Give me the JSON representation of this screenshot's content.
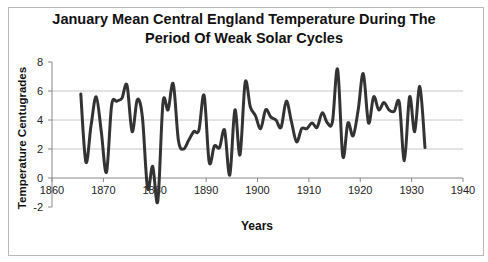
{
  "chart_data": {
    "type": "line",
    "title": "January Mean Central England Temperature During The Period Of Weak Solar Cycles",
    "title_lines": [
      "January Mean Central England Temperature During The",
      "Period Of Weak Solar Cycles"
    ],
    "xlabel": "Years",
    "ylabel": "Temperature Centugrades",
    "xlim": [
      1860,
      1940
    ],
    "ylim": [
      -2,
      8
    ],
    "x_ticks": [
      1860,
      1870,
      1880,
      1890,
      1900,
      1910,
      1920,
      1930,
      1940
    ],
    "y_ticks": [
      -2,
      0,
      2,
      4,
      6,
      8
    ],
    "grid": {
      "horizontal": [
        2,
        4,
        6
      ],
      "vertical": false
    },
    "legend": null,
    "series": [
      {
        "name": "January Mean CET",
        "color": "#333333",
        "x": [
          1866,
          1867,
          1868,
          1869,
          1870,
          1871,
          1872,
          1873,
          1874,
          1875,
          1876,
          1877,
          1878,
          1879,
          1880,
          1881,
          1882,
          1883,
          1884,
          1885,
          1886,
          1887,
          1888,
          1889,
          1890,
          1891,
          1892,
          1893,
          1894,
          1895,
          1896,
          1897,
          1898,
          1899,
          1900,
          1901,
          1902,
          1903,
          1904,
          1905,
          1906,
          1907,
          1908,
          1909,
          1910,
          1911,
          1912,
          1913,
          1914,
          1915,
          1916,
          1917,
          1918,
          1919,
          1920,
          1921,
          1922,
          1923,
          1924,
          1925,
          1926,
          1927,
          1928,
          1929,
          1930,
          1931,
          1932,
          1933
        ],
        "values": [
          5.8,
          1.1,
          3.6,
          5.6,
          3.2,
          0.4,
          5.0,
          5.3,
          5.5,
          6.4,
          3.2,
          5.4,
          4.2,
          -0.7,
          0.8,
          -1.6,
          5.2,
          4.7,
          6.5,
          2.6,
          2.0,
          2.6,
          3.2,
          3.3,
          5.7,
          1.1,
          2.2,
          2.1,
          3.3,
          0.2,
          4.7,
          1.6,
          6.6,
          4.9,
          4.3,
          3.4,
          4.7,
          4.2,
          4.0,
          3.5,
          5.3,
          3.9,
          2.5,
          3.4,
          3.4,
          3.8,
          3.5,
          4.5,
          3.8,
          3.9,
          7.5,
          1.5,
          3.8,
          2.9,
          4.7,
          7.2,
          3.8,
          5.6,
          4.7,
          5.2,
          4.7,
          4.6,
          5.2,
          1.2,
          5.6,
          3.2,
          6.3,
          2.1
        ]
      }
    ]
  }
}
